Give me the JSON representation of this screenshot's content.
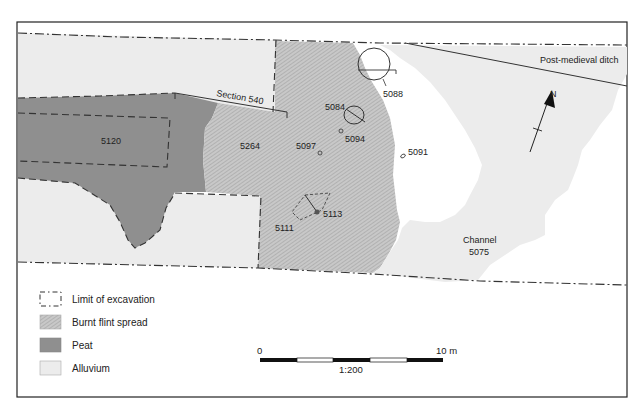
{
  "figure": {
    "type": "archaeological site plan",
    "scale_ratio": "1:200"
  },
  "labels": {
    "section": "Section 540",
    "ditch": "Post-medieval ditch",
    "context_5120": "5120",
    "context_5264": "5264",
    "context_5097": "5097",
    "context_5094": "5094",
    "context_5084": "5084",
    "context_5088": "5088",
    "context_5091": "5091",
    "context_5113": "5113",
    "context_5111": "5111",
    "channel_name": "Channel",
    "channel_number": "5075",
    "north": "N"
  },
  "legend": {
    "items": [
      {
        "label": "Limit of excavation",
        "symbol": "dashed-box"
      },
      {
        "label": "Burnt flint spread",
        "symbol": "hatched-gray"
      },
      {
        "label": "Peat",
        "symbol": "dark-gray"
      },
      {
        "label": "Alluvium",
        "symbol": "light-gray"
      }
    ]
  },
  "scale_bar": {
    "start": "0",
    "end": "10 m",
    "ratio": "1:200",
    "segments": 5
  },
  "colors": {
    "peat": "#8f8f8f",
    "alluvium": "#ececec",
    "burnt_flint": "#c4c4c4",
    "hatch": "#a8a8a8",
    "line": "#222222"
  }
}
